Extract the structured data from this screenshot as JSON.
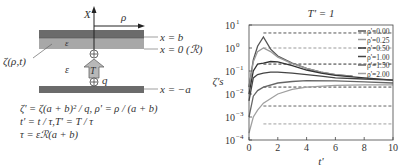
{
  "diagram": {
    "axis_x_label": "X",
    "axis_rho_label": "ρ",
    "zeta_label": "ζ(ρ,t)",
    "layer_eps_label": "ε",
    "gap_eps_label": "ε",
    "T_label": "T",
    "q_label": "q",
    "plus_symbol": "+",
    "line_labels": [
      "x = b",
      "x = 0 (ℛ)",
      "x = −a"
    ],
    "equations": [
      "ζ' = ζ(a + b)² / q, ρ' = ρ / (a + b)",
      "t' = t / τ,T' = T / τ",
      "τ = εℛ(a + b)"
    ],
    "colors": {
      "dark_bar": "#6b6b6b",
      "light_bar": "#a8a8a8",
      "arrow_fill": "#b8b8b8"
    }
  },
  "chart_data": {
    "type": "line",
    "title": "T' = 1",
    "xlabel": "t'",
    "ylabel": "ζ's",
    "xlim": [
      0,
      10
    ],
    "ylim": [
      0.0001,
      10
    ],
    "yscale": "log",
    "xticks": [
      "0",
      "2",
      "4",
      "6",
      "8",
      "10"
    ],
    "yticks": [
      "10^1",
      "10^0",
      "10^-1",
      "10^-2",
      "10^-3",
      "10^-4"
    ],
    "legend_position": "upper right",
    "grid": false,
    "series": [
      {
        "name": "ρ' = 0.00",
        "color": "#555555",
        "x": [
          0,
          0.3,
          0.6,
          1.0,
          1.5,
          2,
          3,
          4,
          5,
          6,
          7.2
        ],
        "y": [
          0.02,
          0.3,
          1.2,
          3.0,
          0.9,
          0.45,
          0.22,
          0.13,
          0.09,
          0.07,
          0.06
        ],
        "steady_state": 4.5
      },
      {
        "name": "ρ' = 0.25",
        "color": "#9a9a9a",
        "x": [
          0,
          0.3,
          0.6,
          1.0,
          1.5,
          2,
          3,
          4,
          5,
          6,
          7
        ],
        "y": [
          0.02,
          0.25,
          0.7,
          1.0,
          0.7,
          0.4,
          0.21,
          0.13,
          0.09,
          0.07,
          0.06
        ],
        "steady_state": 1.0
      },
      {
        "name": "ρ' = 0.50",
        "color": "#333333",
        "x": [
          0,
          0.3,
          0.6,
          1.0,
          1.5,
          2,
          3,
          4,
          5,
          6,
          8,
          10
        ],
        "y": [
          0.01,
          0.1,
          0.2,
          0.22,
          0.26,
          0.25,
          0.17,
          0.11,
          0.08,
          0.065,
          0.05,
          0.04
        ],
        "steady_state": 0.2
      },
      {
        "name": "ρ' = 1.00",
        "color": "#444444",
        "x": [
          0,
          0.3,
          0.6,
          1.0,
          1.5,
          2,
          3,
          4,
          5,
          6,
          8,
          10
        ],
        "y": [
          0.005,
          0.05,
          0.07,
          0.08,
          0.09,
          0.09,
          0.08,
          0.07,
          0.06,
          0.05,
          0.045,
          0.04
        ],
        "steady_state": 0.02
      },
      {
        "name": "ρ' = 1.50",
        "color": "#666666",
        "x": [
          0,
          0.3,
          0.6,
          1.0,
          2,
          3,
          4,
          6,
          8,
          10
        ],
        "y": [
          0.001,
          0.008,
          0.014,
          0.02,
          0.03,
          0.035,
          0.038,
          0.037,
          0.034,
          0.03
        ],
        "steady_state": 0.003
      },
      {
        "name": "ρ' = 2.00",
        "color": "#a0a0a0",
        "x": [
          0,
          0.3,
          0.6,
          1.0,
          2,
          3,
          4,
          6,
          8,
          10
        ],
        "y": [
          0.0002,
          0.001,
          0.002,
          0.004,
          0.01,
          0.016,
          0.02,
          0.024,
          0.025,
          0.025
        ],
        "steady_state": 0.0005
      }
    ]
  }
}
